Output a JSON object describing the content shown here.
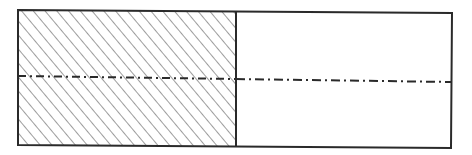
{
  "diagram": {
    "type": "hatched-rectangle-section",
    "colors": {
      "stroke": "#2a2a2a",
      "hatch": "#4a4a4a",
      "background": "#ffffff"
    },
    "outer_rect": {
      "x": 18,
      "y": 10,
      "width": 434,
      "height": 137
    },
    "divider_x": 236,
    "hatched_region": "left",
    "center_line": {
      "y_left": 76,
      "y_right": 82,
      "style": "dash-dot"
    },
    "labels": []
  }
}
